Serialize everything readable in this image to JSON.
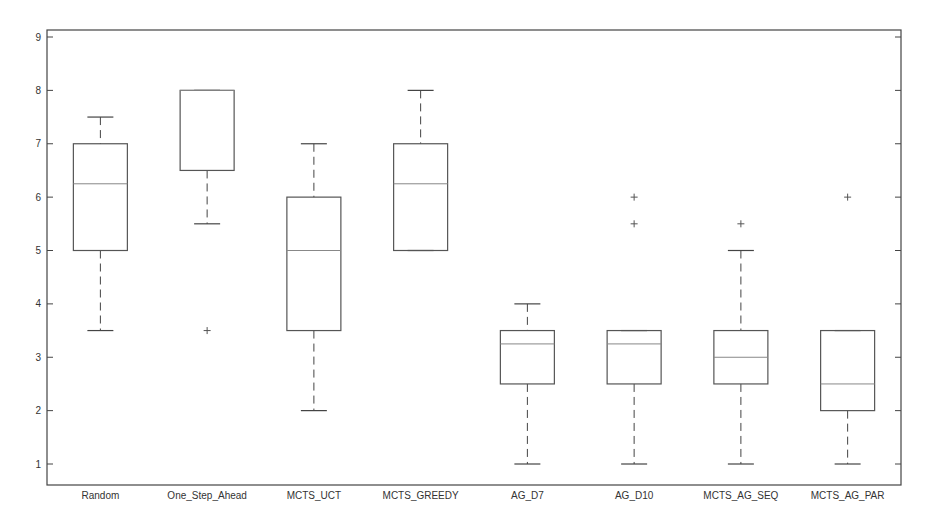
{
  "chart_data": {
    "type": "boxplot",
    "title": "",
    "xlabel": "",
    "ylabel": "",
    "ylim": [
      0.6,
      9.15
    ],
    "yticks": [
      1,
      2,
      3,
      4,
      5,
      6,
      7,
      8,
      9
    ],
    "grid": false,
    "legend": null,
    "categories": [
      "Random",
      "One_Step_Ahead",
      "MCTS_UCT",
      "MCTS_GREEDY",
      "AG_D7",
      "AG_D10",
      "MCTS_AG_SEQ",
      "MCTS_AG_PAR"
    ],
    "boxes": [
      {
        "name": "Random",
        "whisker_low": 3.5,
        "q1": 5.0,
        "median": 6.25,
        "q3": 7.0,
        "whisker_high": 7.5,
        "outliers": []
      },
      {
        "name": "One_Step_Ahead",
        "whisker_low": 5.5,
        "q1": 6.5,
        "median": 8.0,
        "q3": 8.0,
        "whisker_high": 8.0,
        "outliers": [
          3.5
        ]
      },
      {
        "name": "MCTS_UCT",
        "whisker_low": 2.0,
        "q1": 3.5,
        "median": 5.0,
        "q3": 6.0,
        "whisker_high": 7.0,
        "outliers": []
      },
      {
        "name": "MCTS_GREEDY",
        "whisker_low": 5.0,
        "q1": 5.0,
        "median": 6.25,
        "q3": 7.0,
        "whisker_high": 8.0,
        "outliers": []
      },
      {
        "name": "AG_D7",
        "whisker_low": 1.0,
        "q1": 2.5,
        "median": 3.25,
        "q3": 3.5,
        "whisker_high": 4.0,
        "outliers": []
      },
      {
        "name": "AG_D10",
        "whisker_low": 1.0,
        "q1": 2.5,
        "median": 3.25,
        "q3": 3.5,
        "whisker_high": 3.5,
        "outliers": [
          5.5,
          6.0
        ]
      },
      {
        "name": "MCTS_AG_SEQ",
        "whisker_low": 1.0,
        "q1": 2.5,
        "median": 3.0,
        "q3": 3.5,
        "whisker_high": 5.0,
        "outliers": [
          5.5
        ]
      },
      {
        "name": "MCTS_AG_PAR",
        "whisker_low": 1.0,
        "q1": 2.0,
        "median": 2.5,
        "q3": 3.5,
        "whisker_high": 3.5,
        "outliers": [
          6.0
        ]
      }
    ]
  },
  "colors": {
    "axis": "#444444",
    "box": "#555555",
    "median": "#888888",
    "whisker": "#444444",
    "outlier": "#555555",
    "background": "#ffffff"
  }
}
